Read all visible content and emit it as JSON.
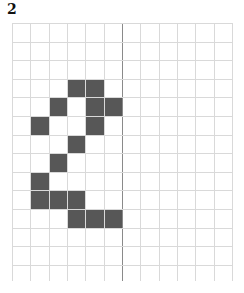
{
  "figure": {
    "label": "2",
    "grid": {
      "columns": 12,
      "rows": 13,
      "cell_width": 18.33,
      "cell_height": 18.6,
      "axis_after_column": 6,
      "line_color": "#d9d9d9",
      "axis_color": "#8a8a8a"
    },
    "fill_color": "#575757",
    "filled_cells": [
      {
        "row": 3,
        "col": 3
      },
      {
        "row": 3,
        "col": 4
      },
      {
        "row": 4,
        "col": 2
      },
      {
        "row": 4,
        "col": 4
      },
      {
        "row": 4,
        "col": 5
      },
      {
        "row": 5,
        "col": 1
      },
      {
        "row": 5,
        "col": 4
      },
      {
        "row": 6,
        "col": 3
      },
      {
        "row": 7,
        "col": 2
      },
      {
        "row": 8,
        "col": 1
      },
      {
        "row": 9,
        "col": 1
      },
      {
        "row": 9,
        "col": 2
      },
      {
        "row": 9,
        "col": 3
      },
      {
        "row": 10,
        "col": 3
      },
      {
        "row": 10,
        "col": 4
      },
      {
        "row": 10,
        "col": 5
      }
    ]
  }
}
